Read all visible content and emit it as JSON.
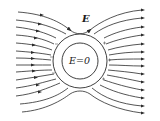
{
  "diagram": {
    "labels": {
      "field": "E",
      "inside": "E=0"
    },
    "colors": {
      "line": "#2a2a2a",
      "background": "#ffffff"
    },
    "elements": [
      {
        "type": "outer-circle",
        "description": "conducting shell outer surface"
      },
      {
        "type": "inner-circle",
        "description": "cavity boundary, field is zero inside"
      },
      {
        "type": "field-lines",
        "direction": "left-to-right",
        "count_left": 11,
        "count_right": 11
      },
      {
        "type": "induced-charges",
        "left_side": "negative",
        "right_side": "positive"
      }
    ]
  }
}
